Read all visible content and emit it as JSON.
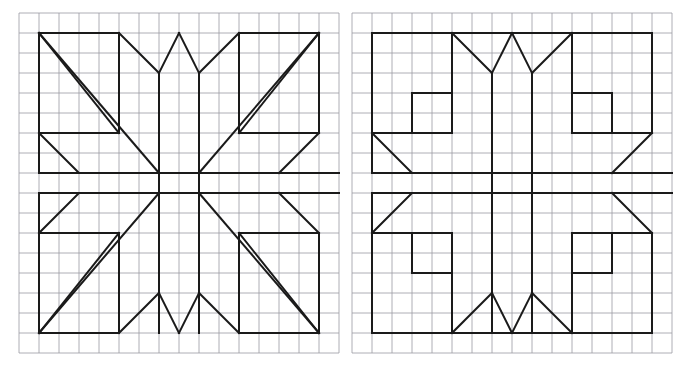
{
  "page": {
    "background_color": "#ffffff",
    "ink_color": "#1a1a1a",
    "grid_color": "#9a9aa2",
    "grid_minor_color": "#c8c8d0"
  },
  "grid": {
    "cell_size_px": 20,
    "stroke_width": 0.8,
    "description": "light blue-grey graph paper ruling behind each drawing"
  },
  "figures": [
    {
      "id": "left-figure",
      "name": "starburst-block-with-diagonals",
      "grid_origin_px": {
        "x": 19,
        "y": 13
      },
      "grid_cols": 16,
      "grid_rows": 17,
      "frame_cells": {
        "x0": 1,
        "y0": 1,
        "x1": 15,
        "y1": 16
      },
      "outline_stroke_width": 2.0,
      "paths": [
        "M 1,1 L 5,1",
        "M 11,1 L 15,1",
        "M 1,16 L 5,16",
        "M 11,16 L 15,16",
        "M 1,1 L 1,6",
        "M 1,11 L 1,16",
        "M 15,1 L 15,6",
        "M 15,11 L 15,16",
        "M 5,1 L 5,6 L 1,6",
        "M 11,1 L 11,6 L 15,6",
        "M 5,16 L 5,11 L 1,11",
        "M 11,16 L 11,11 L 15,11",
        "M 5,1 L 7,3 L 7,16",
        "M 11,1 L 9,3 L 9,16",
        "M 8,1 L 7,3",
        "M 8,1 L 9,3",
        "M 5,16 L 7,14",
        "M 11,16 L 9,14",
        "M 8,16 L 7,14",
        "M 8,16 L 9,14",
        "M 1,6 L 3,8 L 16,8",
        "M 1,11 L 3,9 L 16,9",
        "M 1,8 L 3,8",
        "M 1,9 L 3,9",
        "M 1,6 L 1,8",
        "M 1,9 L 1,11",
        "M 15,6 L 13,8",
        "M 15,11 L 13,9",
        "M 15,8 L 13,8",
        "M 15,9 L 13,9",
        "M 1,1 L 7,8",
        "M 1,1 L 5,6",
        "M 15,1 L 9,8",
        "M 15,1 L 11,6",
        "M 1,16 L 7,9",
        "M 1,16 L 5,11",
        "M 15,16 L 9,9",
        "M 15,16 L 11,11"
      ]
    },
    {
      "id": "right-figure",
      "name": "starburst-block-with-steps",
      "grid_origin_px": {
        "x": 352,
        "y": 13
      },
      "grid_cols": 16,
      "grid_rows": 17,
      "frame_cells": {
        "x0": 1,
        "y0": 1,
        "x1": 15,
        "y1": 16
      },
      "outline_stroke_width": 2.0,
      "paths": [
        "M 1,1 L 15,1",
        "M 1,16 L 15,16",
        "M 1,1 L 1,6",
        "M 1,11 L 1,16",
        "M 15,1 L 15,6",
        "M 15,11 L 15,16",
        "M 5,1 L 5,6 L 1,6",
        "M 11,1 L 11,6 L 15,6",
        "M 5,16 L 5,11 L 1,11",
        "M 11,16 L 11,11 L 15,11",
        "M 5,1 L 7,3 L 7,16",
        "M 11,1 L 9,3 L 9,16",
        "M 8,1 L 7,3",
        "M 8,1 L 9,3",
        "M 5,16 L 7,14",
        "M 11,16 L 9,14",
        "M 8,16 L 7,14",
        "M 8,16 L 9,14",
        "M 1,6 L 3,8 L 16,8",
        "M 1,11 L 3,9 L 16,9",
        "M 1,8 L 3,8",
        "M 1,9 L 3,9",
        "M 1,6 L 1,8",
        "M 1,9 L 1,11",
        "M 15,6 L 13,8",
        "M 15,11 L 13,9",
        "M 15,8 L 13,8",
        "M 15,9 L 13,9",
        "M 5,6 L 5,4 L 3,4 L 3,6",
        "M 11,6 L 11,4 L 13,4 L 13,6",
        "M 5,11 L 5,13 L 3,13 L 3,11",
        "M 11,11 L 11,13 L 13,13 L 13,11"
      ]
    }
  ]
}
